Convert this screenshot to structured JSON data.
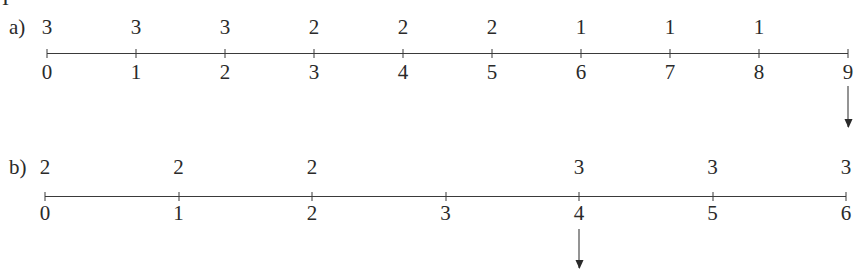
{
  "crop_fragment": "I",
  "parts": [
    {
      "label": "a)",
      "tick_labels": [
        "0",
        "1",
        "2",
        "3",
        "4",
        "5",
        "6",
        "7",
        "8",
        "9"
      ],
      "values": [
        {
          "at": 0,
          "value": "3"
        },
        {
          "at": 1,
          "value": "3"
        },
        {
          "at": 2,
          "value": "3"
        },
        {
          "at": 3,
          "value": "2"
        },
        {
          "at": 4,
          "value": "2"
        },
        {
          "at": 5,
          "value": "2"
        },
        {
          "at": 6,
          "value": "1"
        },
        {
          "at": 7,
          "value": "1"
        },
        {
          "at": 8,
          "value": "1"
        }
      ],
      "arrow_at": "9"
    },
    {
      "label": "b)",
      "tick_labels": [
        "0",
        "1",
        "2",
        "3",
        "4",
        "5",
        "6"
      ],
      "values": [
        {
          "at": 0,
          "value": "2"
        },
        {
          "at": 1,
          "value": "2"
        },
        {
          "at": 2,
          "value": "2"
        },
        {
          "at": 4,
          "value": "3"
        },
        {
          "at": 5,
          "value": "3"
        },
        {
          "at": 6,
          "value": "3"
        }
      ],
      "arrow_at": "4"
    }
  ]
}
